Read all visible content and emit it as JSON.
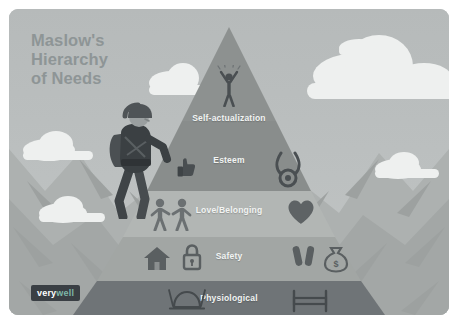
{
  "illustration": {
    "title_lines": [
      "Maslow's",
      "Hierarchy",
      "of Needs"
    ],
    "logo": {
      "part1": "very",
      "part2": "well"
    },
    "colors": {
      "sky": "#b9bdbd",
      "cloud": "#eef0ef",
      "mountain_ridge": "#a9adac",
      "title_text": "#8e9596",
      "tier_label_text": "#f2f4f3",
      "logo_background": "#3a3f44",
      "logo_accent": "#7fb8a8",
      "figure": "#4a4f52"
    },
    "pyramid": {
      "tiers": [
        {
          "id": "self-actualization",
          "label": "Self-actualization",
          "color": "#8d9190",
          "icons": [
            "person-arms-raised-icon"
          ]
        },
        {
          "id": "esteem",
          "label": "Esteem",
          "color": "#8d9190",
          "icons": [
            "thumbs-up-icon",
            "medal-icon"
          ]
        },
        {
          "id": "love-belonging",
          "label": "Love/Belonging",
          "color": "#b2b6b4",
          "icons": [
            "two-people-holding-hands-icon",
            "heart-icon"
          ]
        },
        {
          "id": "safety",
          "label": "Safety",
          "color": "#a2a6a4",
          "icons": [
            "house-icon",
            "padlock-icon",
            "pills-icon",
            "money-bag-icon"
          ]
        },
        {
          "id": "physiological",
          "label": "Physiological",
          "color": "#6f7477",
          "icons": [
            "food-plate-icon",
            "bed-icon"
          ]
        }
      ]
    },
    "figures": {
      "climber": "mountain-climber-figure"
    }
  }
}
